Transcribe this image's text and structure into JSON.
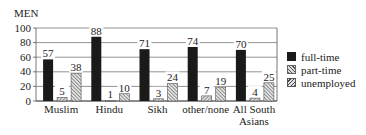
{
  "chart_data": {
    "type": "bar",
    "title": "MEN",
    "xlabel": "",
    "ylabel": "",
    "ylim": [
      0,
      100
    ],
    "yticks": [
      0,
      20,
      40,
      60,
      80,
      100
    ],
    "grid": true,
    "legend_position": "right",
    "categories": [
      "Muslim",
      "Hindu",
      "Sikh",
      "other/none",
      "All South Asians"
    ],
    "category_lines": [
      [
        "Muslim"
      ],
      [
        "Hindu"
      ],
      [
        "Sikh"
      ],
      [
        "other/none"
      ],
      [
        "All South",
        "Asians"
      ]
    ],
    "series": [
      {
        "name": "full-time",
        "values": [
          57,
          88,
          71,
          74,
          70
        ],
        "color": "#1a1a1a"
      },
      {
        "name": "part-time",
        "values": [
          5,
          1,
          3,
          7,
          4
        ],
        "color": "#aaaaaa"
      },
      {
        "name": "unemployed",
        "values": [
          38,
          10,
          24,
          19,
          25
        ],
        "color": "#888888"
      }
    ]
  },
  "legend": {
    "items": [
      {
        "label": "full-time"
      },
      {
        "label": "part-time"
      },
      {
        "label": "unemployed"
      }
    ]
  }
}
